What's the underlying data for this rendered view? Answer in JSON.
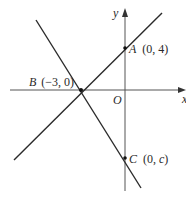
{
  "diagram": {
    "type": "coordinate-geometry",
    "axes": {
      "x_label": "x",
      "y_label": "y",
      "origin_label": "O"
    },
    "points": [
      {
        "name": "A",
        "coords": "(0, 4)",
        "label": "(0, 4)"
      },
      {
        "name": "B",
        "coords": "(−3, 0)",
        "label": "(−3, 0)"
      },
      {
        "name": "C",
        "coords": "(0, c)",
        "label_pre": "(0, ",
        "label_var": "c",
        "label_post": ")"
      }
    ],
    "lines": [
      {
        "name": "line-AB",
        "through": [
          "B",
          "A"
        ]
      },
      {
        "name": "line-BC",
        "through": [
          "B",
          "C"
        ]
      }
    ],
    "colors": {
      "stroke": "#2a2a2a",
      "axis": "#555555",
      "background": "#ffffff"
    }
  }
}
